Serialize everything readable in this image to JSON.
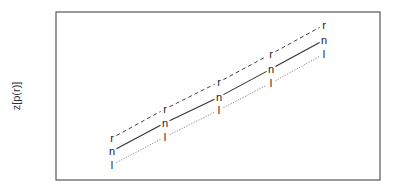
{
  "chart_data": {
    "type": "line",
    "title": "",
    "xlabel": "",
    "ylabel": "z[p(r)]",
    "grid": false,
    "legend": null,
    "x": [
      1,
      2,
      3,
      4,
      5
    ],
    "series": [
      {
        "name": "r",
        "marker": "r",
        "style": "dashed",
        "color": "#444444",
        "values": [
          1.3,
          2.3,
          3.3,
          4.3,
          5.3
        ]
      },
      {
        "name": "n",
        "marker": "n",
        "style": "solid",
        "color": "#333333",
        "values": [
          0.8,
          1.8,
          2.75,
          3.75,
          4.75
        ]
      },
      {
        "name": "l",
        "marker": "l",
        "style": "dotted",
        "color": "#888888",
        "values": [
          0.3,
          1.3,
          2.3,
          3.25,
          4.25
        ]
      }
    ],
    "pixel_points": {
      "x": [
        112,
        165,
        219,
        271,
        324
      ],
      "r": [
        138,
        109,
        82,
        54,
        25
      ],
      "n": [
        151,
        123,
        97,
        69,
        40
      ],
      "l": [
        165,
        137,
        110,
        83,
        54
      ]
    },
    "frame": {
      "left": 56,
      "top": 12,
      "right": 380,
      "bottom": 180
    }
  }
}
